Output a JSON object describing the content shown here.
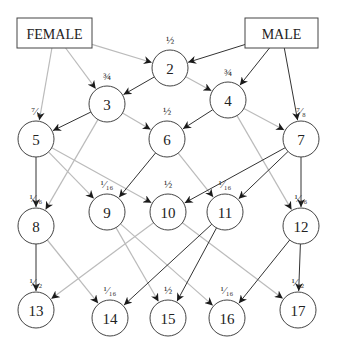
{
  "diagram": {
    "parents": [
      {
        "id": "FEMALE",
        "label": "FEMALE",
        "x": 17,
        "y": 18,
        "w": 75,
        "h": 30
      },
      {
        "id": "MALE",
        "label": "MALE",
        "x": 245,
        "y": 18,
        "w": 73,
        "h": 30
      }
    ],
    "nodes": [
      {
        "id": "2",
        "label": "2",
        "fraction": "½",
        "x": 170,
        "y": 68
      },
      {
        "id": "3",
        "label": "3",
        "fraction": "¾",
        "x": 107,
        "y": 104
      },
      {
        "id": "4",
        "label": "4",
        "fraction": "¾",
        "x": 228,
        "y": 100
      },
      {
        "id": "5",
        "label": "5",
        "fraction": "⁷⁄₈",
        "x": 36,
        "y": 139
      },
      {
        "id": "6",
        "label": "6",
        "fraction": "½",
        "x": 167,
        "y": 139
      },
      {
        "id": "7",
        "label": "7",
        "fraction": "⁷⁄₈",
        "x": 301,
        "y": 139
      },
      {
        "id": "8",
        "label": "8",
        "fraction": "¹⁄₁₆",
        "x": 36,
        "y": 226
      },
      {
        "id": "9",
        "label": "9",
        "fraction": "¹⁄₁₆",
        "x": 107,
        "y": 212
      },
      {
        "id": "10",
        "label": "10",
        "fraction": "½",
        "x": 168,
        "y": 212
      },
      {
        "id": "11",
        "label": "11",
        "fraction": "¹⁄₁₆",
        "x": 225,
        "y": 212
      },
      {
        "id": "12",
        "label": "12",
        "fraction": "¹⁄₁₆",
        "x": 301,
        "y": 226
      },
      {
        "id": "13",
        "label": "13",
        "fraction": "¹⁄₃₂",
        "x": 36,
        "y": 310
      },
      {
        "id": "14",
        "label": "14",
        "fraction": "¹⁄₁₆",
        "x": 110,
        "y": 318
      },
      {
        "id": "15",
        "label": "15",
        "fraction": "½",
        "x": 168,
        "y": 318
      },
      {
        "id": "16",
        "label": "16",
        "fraction": "¹⁄₁₆",
        "x": 227,
        "y": 318
      },
      {
        "id": "17",
        "label": "17",
        "fraction": "¹⁄₃₂",
        "x": 298,
        "y": 310
      }
    ],
    "node_radius": 18,
    "edges": [
      {
        "from": "FEMALE",
        "to": "2",
        "style": "light"
      },
      {
        "from": "FEMALE",
        "to": "3",
        "style": "light"
      },
      {
        "from": "FEMALE",
        "to": "5",
        "style": "light"
      },
      {
        "from": "MALE",
        "to": "2",
        "style": "dark"
      },
      {
        "from": "MALE",
        "to": "4",
        "style": "dark"
      },
      {
        "from": "MALE",
        "to": "7",
        "style": "dark"
      },
      {
        "from": "2",
        "to": "3",
        "style": "dark"
      },
      {
        "from": "2",
        "to": "4",
        "style": "light"
      },
      {
        "from": "3",
        "to": "5",
        "style": "dark"
      },
      {
        "from": "3",
        "to": "6",
        "style": "light"
      },
      {
        "from": "3",
        "to": "8",
        "style": "light"
      },
      {
        "from": "4",
        "to": "6",
        "style": "dark"
      },
      {
        "from": "4",
        "to": "7",
        "style": "light"
      },
      {
        "from": "4",
        "to": "12",
        "style": "light"
      },
      {
        "from": "5",
        "to": "8",
        "style": "dark"
      },
      {
        "from": "5",
        "to": "9",
        "style": "light"
      },
      {
        "from": "5",
        "to": "10",
        "style": "light"
      },
      {
        "from": "6",
        "to": "9",
        "style": "dark"
      },
      {
        "from": "6",
        "to": "11",
        "style": "light"
      },
      {
        "from": "7",
        "to": "10",
        "style": "dark"
      },
      {
        "from": "7",
        "to": "11",
        "style": "dark"
      },
      {
        "from": "7",
        "to": "12",
        "style": "dark"
      },
      {
        "from": "8",
        "to": "13",
        "style": "dark"
      },
      {
        "from": "8",
        "to": "14",
        "style": "light"
      },
      {
        "from": "9",
        "to": "15",
        "style": "light"
      },
      {
        "from": "9",
        "to": "16",
        "style": "light"
      },
      {
        "from": "10",
        "to": "13",
        "style": "light"
      },
      {
        "from": "10",
        "to": "17",
        "style": "light"
      },
      {
        "from": "11",
        "to": "14",
        "style": "dark"
      },
      {
        "from": "11",
        "to": "15",
        "style": "dark"
      },
      {
        "from": "12",
        "to": "16",
        "style": "dark"
      },
      {
        "from": "12",
        "to": "17",
        "style": "dark"
      }
    ],
    "colors": {
      "dark_edge": "#333333",
      "light_edge": "#bbbbbb",
      "stroke": "#444444"
    }
  }
}
